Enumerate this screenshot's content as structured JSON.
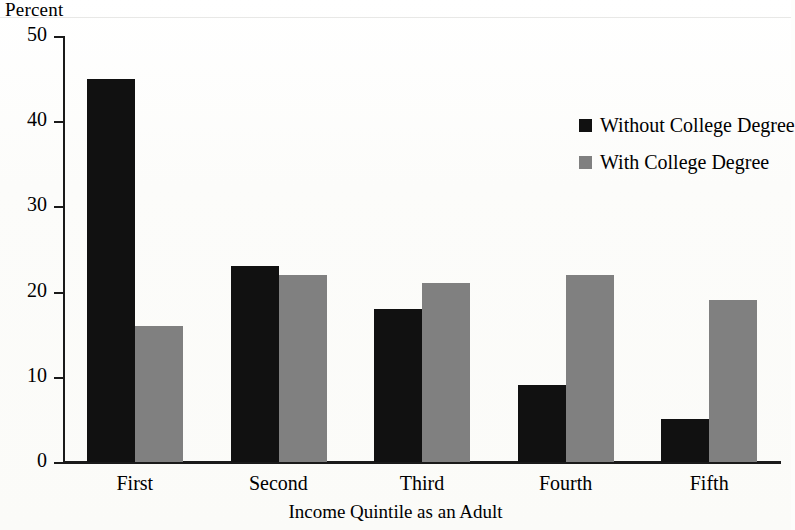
{
  "chart_data": {
    "type": "bar",
    "title": "",
    "subtitle": "",
    "xlabel": "Income Quintile as an Adult",
    "ylabel": "Percent",
    "categories": [
      "First",
      "Second",
      "Third",
      "Fourth",
      "Fifth"
    ],
    "series": [
      {
        "name": "Without College Degree",
        "color": "#111111",
        "values": [
          45,
          23,
          18,
          9,
          5
        ]
      },
      {
        "name": "With College Degree",
        "color": "#808080",
        "values": [
          16,
          22,
          21,
          22,
          19
        ]
      }
    ],
    "ylim": [
      0,
      50
    ],
    "ytick_values": [
      50,
      40,
      30,
      20,
      10,
      0
    ],
    "ytick_labels": [
      "50",
      "40",
      "30",
      "20",
      "10",
      "0"
    ],
    "grid": false,
    "legend_position": "upper-right-inside",
    "background_color": "#fdfdfb",
    "axis_color": "#1a1a1a"
  }
}
